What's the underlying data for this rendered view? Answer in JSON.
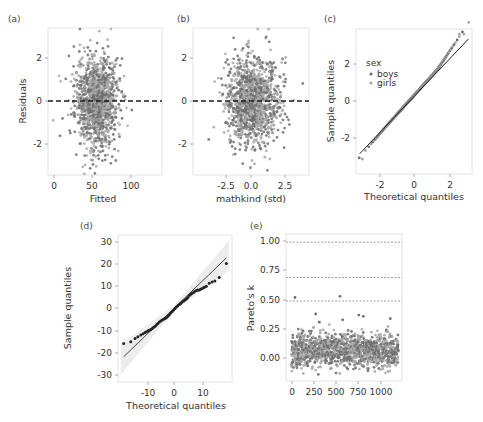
{
  "figure": {
    "width": 483,
    "height": 422,
    "colors": {
      "point_dark": "#6f6f6f",
      "point_light": "#a9a9a9",
      "point_black": "#222222",
      "line": "#333333",
      "ref_dashed": "#1a1a1a",
      "pareto_dashed": "#8a8a8a",
      "band": "#e6e6e6",
      "frame": "#d9d9d9"
    }
  },
  "chart_data": [
    {
      "id": "a",
      "panel_label": "(a)",
      "type": "scatter",
      "title": "",
      "xlabel": "Fitted",
      "ylabel": "Residuals",
      "xlim": [
        -8,
        140
      ],
      "ylim": [
        -3.3,
        3.3
      ],
      "xticks": [
        0,
        50,
        100
      ],
      "xtick_labels": [
        "0",
        "50",
        "100"
      ],
      "yticks": [
        -2,
        0,
        2
      ],
      "ytick_labels": [
        "-2",
        "0",
        "2"
      ],
      "reference_line": {
        "y": 0,
        "style": "dashed"
      },
      "n_points": 1190,
      "point_cloud": {
        "x_mean": 55,
        "x_sd": 14,
        "y_mean": 0,
        "y_sd": 1.0
      },
      "grid": false,
      "series": [
        {
          "name": "residuals",
          "color": "#7a7a7a"
        }
      ]
    },
    {
      "id": "b",
      "panel_label": "(b)",
      "type": "scatter",
      "title": "",
      "xlabel": "mathkind (std)",
      "ylabel": "",
      "xlim": [
        -4.6,
        4.3
      ],
      "ylim": [
        -3.3,
        3.3
      ],
      "xticks": [
        -2.5,
        0.0,
        2.5
      ],
      "xtick_labels": [
        "-2.5",
        "0.0",
        "2.5"
      ],
      "yticks": [
        -2,
        0,
        2
      ],
      "ytick_labels": [
        "-2",
        "0",
        "2"
      ],
      "reference_line": {
        "y": 0,
        "style": "dashed"
      },
      "n_points": 1190,
      "point_cloud": {
        "x_mean": 0,
        "x_sd": 1.0,
        "y_mean": 0,
        "y_sd": 1.0
      },
      "grid": false,
      "series": [
        {
          "name": "residuals",
          "color": "#7a7a7a"
        }
      ]
    },
    {
      "id": "c",
      "panel_label": "(c)",
      "type": "scatter",
      "title": "",
      "xlabel": "Theoretical quantiles",
      "ylabel": "Sample quantiles",
      "xlim": [
        -3.2,
        3.2
      ],
      "ylim": [
        -3.9,
        3.3
      ],
      "xticks": [
        -2,
        0,
        2
      ],
      "xtick_labels": [
        "-2",
        "0",
        "2"
      ],
      "yticks": [
        -2,
        0,
        2
      ],
      "ytick_labels": [
        "-2",
        "0",
        "2"
      ],
      "reference_line": {
        "slope": 1,
        "intercept": 0,
        "from": [
          -3,
          -2.9
        ],
        "to": [
          3,
          2.8
        ]
      },
      "legend": {
        "title": "sex",
        "position": "upper-left",
        "entries": [
          "boys",
          "girls"
        ]
      },
      "series": [
        {
          "name": "boys",
          "color": "#6f6f6f"
        },
        {
          "name": "girls",
          "color": "#a9a9a9"
        }
      ],
      "extremes": [
        [
          -2.85,
          -3.15
        ],
        [
          2.5,
          3.05
        ],
        [
          2.75,
          3.05
        ]
      ]
    },
    {
      "id": "d",
      "panel_label": "(d)",
      "type": "scatter",
      "title": "",
      "xlabel": "Theoretical quantiles",
      "ylabel": "Sample quantiles",
      "xlim": [
        -20,
        20
      ],
      "ylim": [
        -32,
        32
      ],
      "xticks": [
        -10,
        0,
        10
      ],
      "xtick_labels": [
        "-10",
        "0",
        "10"
      ],
      "yticks": [
        -30,
        -20,
        -10,
        0,
        10,
        20,
        30
      ],
      "ytick_labels": [
        "-30",
        "-20",
        "-10",
        "0",
        "10",
        "20",
        "30"
      ],
      "reference_line": {
        "from": [
          -18,
          -21
        ],
        "to": [
          18,
          22
        ]
      },
      "confidence_band": true,
      "series": [
        {
          "name": "school effects",
          "color": "#222222"
        }
      ],
      "points": [
        [
          -18,
          -15.3
        ],
        [
          -15.5,
          -14.5
        ],
        [
          -14,
          -13
        ],
        [
          -13,
          -12.3
        ],
        [
          -12,
          -11.6
        ],
        [
          -11.2,
          -11
        ],
        [
          -10.5,
          -10.5
        ],
        [
          -10,
          -10.1
        ],
        [
          -9.5,
          -9.8
        ],
        [
          -9,
          -9.5
        ],
        [
          -8.5,
          -9.1
        ],
        [
          -8,
          -8.7
        ],
        [
          -7.5,
          -8.2
        ],
        [
          -7,
          -7.7
        ],
        [
          -6.5,
          -7.1
        ],
        [
          -6,
          -6.5
        ],
        [
          -5.5,
          -5.9
        ],
        [
          -5,
          -5.4
        ],
        [
          -4.5,
          -5
        ],
        [
          -4,
          -4.7
        ],
        [
          -3.5,
          -4.4
        ],
        [
          -3,
          -4
        ],
        [
          -2.5,
          -3.4
        ],
        [
          -2,
          -2.7
        ],
        [
          -1.5,
          -2
        ],
        [
          -1,
          -1.3
        ],
        [
          -0.5,
          -0.6
        ],
        [
          0,
          0
        ],
        [
          0.5,
          0.7
        ],
        [
          1,
          1.2
        ],
        [
          1.5,
          1.7
        ],
        [
          2,
          2.2
        ],
        [
          2.5,
          2.8
        ],
        [
          3,
          3.2
        ],
        [
          3.5,
          3.7
        ],
        [
          4,
          4.1
        ],
        [
          4.5,
          4.8
        ],
        [
          5,
          5.6
        ],
        [
          5.5,
          6.2
        ],
        [
          6,
          6.6
        ],
        [
          6.5,
          7
        ],
        [
          7,
          7.5
        ],
        [
          7.5,
          7.8
        ],
        [
          8,
          8
        ],
        [
          8.5,
          8.1
        ],
        [
          9,
          8.4
        ],
        [
          9.5,
          8.7
        ],
        [
          10,
          9
        ],
        [
          10.5,
          9.3
        ],
        [
          11,
          9.7
        ],
        [
          12,
          11
        ],
        [
          13,
          11.5
        ],
        [
          14,
          12
        ],
        [
          15.5,
          13.5
        ],
        [
          18,
          19.6
        ]
      ]
    },
    {
      "id": "e",
      "panel_label": "(e)",
      "type": "scatter",
      "title": "",
      "xlabel": "",
      "ylabel": "Pareto's k",
      "xlim": [
        -60,
        1230
      ],
      "ylim": [
        -0.18,
        1.07
      ],
      "xticks": [
        0,
        250,
        500,
        750,
        1000
      ],
      "xtick_labels": [
        "0",
        "250",
        "500",
        "750",
        "1000"
      ],
      "yticks": [
        0.0,
        0.25,
        0.5,
        0.75,
        1.0
      ],
      "ytick_labels": [
        "0.00",
        "0.25",
        "0.50",
        "0.75",
        "1.00"
      ],
      "reference_lines": [
        {
          "y": 0.5,
          "style": "dotted"
        },
        {
          "y": 0.7,
          "style": "dotted"
        },
        {
          "y": 1.0,
          "style": "dotted"
        }
      ],
      "n_points": 1190,
      "point_cloud": {
        "y_mean": 0.08,
        "y_sd": 0.07
      },
      "outliers": [
        [
          40,
          0.53
        ],
        [
          540,
          0.54
        ],
        [
          270,
          0.39
        ],
        [
          750,
          0.38
        ],
        [
          800,
          0.37
        ],
        [
          1100,
          0.35
        ],
        [
          310,
          0.32
        ],
        [
          570,
          0.34
        ]
      ],
      "series": [
        {
          "name": "boys",
          "color": "#6f6f6f"
        },
        {
          "name": "girls",
          "color": "#a9a9a9"
        }
      ]
    }
  ]
}
